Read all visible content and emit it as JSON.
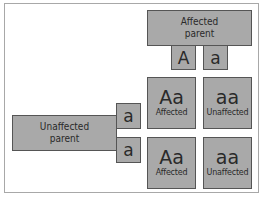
{
  "diagram": {
    "type": "punnett-square",
    "top_parent": {
      "label": "Affected parent",
      "line1": "Affected",
      "line2": "parent",
      "gametes": [
        "A",
        "a"
      ]
    },
    "left_parent": {
      "label": "Unaffected parent",
      "line1": "Unaffected",
      "line2": "parent",
      "gametes": [
        "a",
        "a"
      ]
    },
    "cells": [
      {
        "genotype": "Aa",
        "phenotype": "Affected"
      },
      {
        "genotype": "aa",
        "phenotype": "Unaffected"
      },
      {
        "genotype": "Aa",
        "phenotype": "Affected"
      },
      {
        "genotype": "aa",
        "phenotype": "Unaffected"
      }
    ],
    "colors": {
      "box_fill": "#a9a9a9",
      "box_border": "#555555",
      "text": "#2a2a2a",
      "frame_border": "#a8a8a8",
      "background": "#ffffff"
    }
  }
}
